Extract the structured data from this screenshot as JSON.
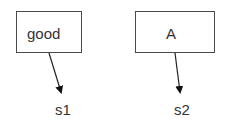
{
  "diagram": {
    "nodes": [
      {
        "id": "box1",
        "label": "good"
      },
      {
        "id": "box2",
        "label": "A"
      }
    ],
    "labels": [
      {
        "id": "s1",
        "text": "s1"
      },
      {
        "id": "s2",
        "text": "s2"
      }
    ],
    "edges": [
      {
        "from": "box1",
        "to": "s1"
      },
      {
        "from": "box2",
        "to": "s2"
      }
    ]
  }
}
